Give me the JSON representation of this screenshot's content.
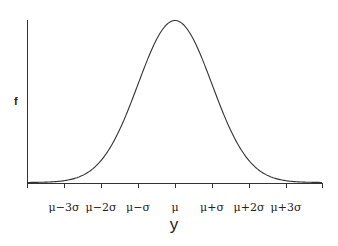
{
  "chart_data": {
    "type": "line",
    "title": "",
    "xlabel": "y",
    "ylabel": "f",
    "tick_labels": [
      "μ−3σ",
      "μ−2σ",
      "μ−σ",
      "μ",
      "μ+σ",
      "μ+2σ",
      "μ+3σ"
    ],
    "tick_positions_sigma": [
      -3,
      -2,
      -1,
      0,
      1,
      2,
      3
    ],
    "x_range_sigma": [
      -4,
      4
    ],
    "y_range": [
      0,
      1
    ],
    "grid": false,
    "legend": null,
    "series": [
      {
        "name": "normal pdf",
        "x_sigma": [
          -4,
          -3.5,
          -3,
          -2.5,
          -2,
          -1.5,
          -1,
          -0.5,
          0,
          0.5,
          1,
          1.5,
          2,
          2.5,
          3,
          3.5,
          4
        ],
        "values_relative": [
          0.0003,
          0.0022,
          0.0111,
          0.0439,
          0.1353,
          0.3247,
          0.6065,
          0.8825,
          1.0,
          0.8825,
          0.6065,
          0.3247,
          0.1353,
          0.0439,
          0.0111,
          0.0022,
          0.0003
        ]
      }
    ],
    "colors": {
      "curve": "#333333",
      "axis": "#333333",
      "text": "#222222"
    }
  },
  "labels": {
    "y_axis": "f",
    "x_axis": "y"
  }
}
